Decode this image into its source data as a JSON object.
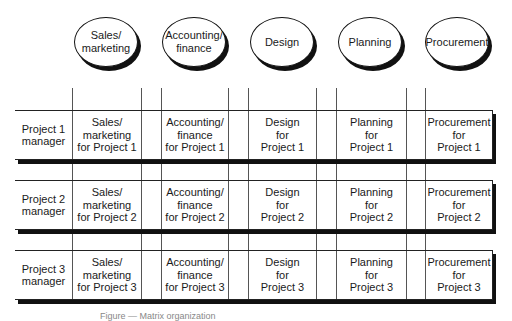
{
  "departments": [
    {
      "label": "Sales/\nmarketing"
    },
    {
      "label": "Accounting/\nfinance"
    },
    {
      "label": "Design"
    },
    {
      "label": "Planning"
    },
    {
      "label": "Procurement"
    }
  ],
  "rows": [
    {
      "manager": "Project 1\nmanager",
      "cells": [
        "Sales/\nmarketing\nfor Project 1",
        "Accounting/\nfinance\nfor Project 1",
        "Design\nfor\nProject 1",
        "Planning\nfor\nProject 1",
        "Procurement\nfor\nProject 1"
      ]
    },
    {
      "manager": "Project 2\nmanager",
      "cells": [
        "Sales/\nmarketing\nfor Project 2",
        "Accounting/\nfinance\nfor Project 2",
        "Design\nfor\nProject 2",
        "Planning\nfor\nProject 2",
        "Procurement\nfor\nProject 2"
      ]
    },
    {
      "manager": "Project 3\nmanager",
      "cells": [
        "Sales/\nmarketing\nfor Project 3",
        "Accounting/\nfinance\nfor Project 3",
        "Design\nfor\nProject 3",
        "Planning\nfor\nProject 3",
        "Procurement\nfor\nProject 3"
      ]
    }
  ],
  "caption": "Figure — Matrix organization"
}
